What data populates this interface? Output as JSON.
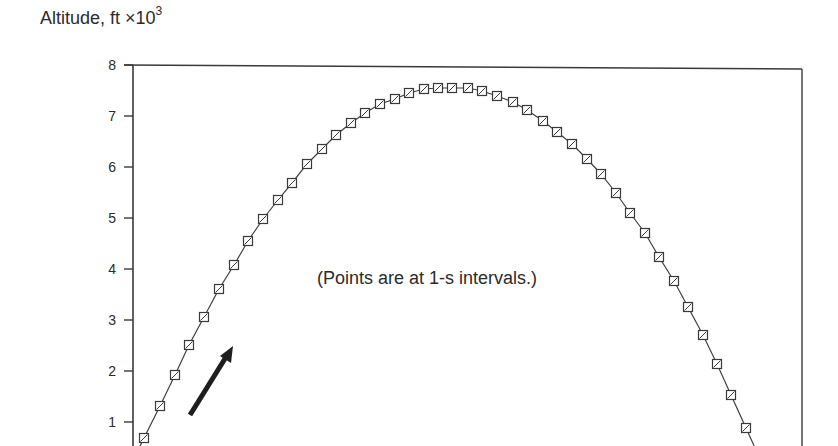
{
  "chart_data": {
    "type": "line",
    "title": "",
    "ylabel": "Altitude, ft ×10³",
    "ylabel_base": "Altitude, ft ×10",
    "ylabel_exp": "3",
    "xlabel": "",
    "annotation": "(Points are at 1-s intervals.)",
    "ylim": [
      0,
      8
    ],
    "yticks": [
      1,
      2,
      3,
      4,
      5,
      6,
      7,
      8
    ],
    "grid": false,
    "legend": null,
    "marker": "square-with-slash",
    "interval_s": 1,
    "series": [
      {
        "name": "Altitude",
        "x": [
          0,
          1,
          2,
          3,
          4,
          5,
          6,
          7,
          8,
          9,
          10,
          11,
          12,
          13,
          14,
          15,
          16,
          17,
          18,
          19,
          20,
          21,
          22,
          23,
          24,
          25,
          26,
          27,
          28,
          29,
          29,
          30,
          31,
          32,
          33,
          34,
          35,
          36,
          37,
          38,
          39,
          40,
          41
        ],
        "values": [
          0.67,
          1.31,
          1.92,
          2.5,
          3.06,
          3.6,
          4.08,
          4.55,
          4.98,
          5.35,
          5.69,
          6.06,
          6.35,
          6.63,
          6.86,
          7.04,
          7.22,
          7.33,
          7.45,
          7.53,
          7.55,
          7.55,
          7.55,
          7.49,
          7.39,
          7.27,
          7.12,
          6.9,
          6.69,
          6.45,
          6.45,
          6.16,
          5.86,
          5.49,
          5.1,
          4.71,
          4.24,
          3.77,
          3.25,
          2.71,
          2.14,
          1.53,
          0.88
        ]
      }
    ],
    "arrow": {
      "direction": "up-right",
      "meaning": "direction of flight"
    }
  },
  "plot": {
    "left": 133,
    "right": 802,
    "top": 65,
    "y0_px": 473,
    "px_per_unit": 51,
    "points_px": [
      [
        144,
        438
      ],
      [
        160,
        406
      ],
      [
        175,
        375
      ],
      [
        189,
        345
      ],
      [
        204,
        317
      ],
      [
        219,
        289
      ],
      [
        234,
        265
      ],
      [
        248,
        241
      ],
      [
        263,
        219
      ],
      [
        278,
        200
      ],
      [
        292,
        183
      ],
      [
        307,
        164
      ],
      [
        322,
        149
      ],
      [
        336,
        135
      ],
      [
        351,
        123
      ],
      [
        365,
        113
      ],
      [
        380,
        104
      ],
      [
        395,
        99
      ],
      [
        409,
        93
      ],
      [
        424,
        89
      ],
      [
        438,
        88
      ],
      [
        452,
        88
      ],
      [
        468,
        88
      ],
      [
        482,
        91
      ],
      [
        497,
        96
      ],
      [
        513,
        102
      ],
      [
        527,
        110
      ],
      [
        543,
        121
      ],
      [
        557,
        132
      ],
      [
        572,
        144
      ],
      [
        587,
        159
      ],
      [
        601,
        174
      ],
      [
        616,
        193
      ],
      [
        630,
        213
      ],
      [
        645,
        233
      ],
      [
        659,
        257
      ],
      [
        674,
        281
      ],
      [
        688,
        307
      ],
      [
        703,
        335
      ],
      [
        717,
        364
      ],
      [
        731,
        395
      ],
      [
        746,
        428
      ]
    ]
  }
}
